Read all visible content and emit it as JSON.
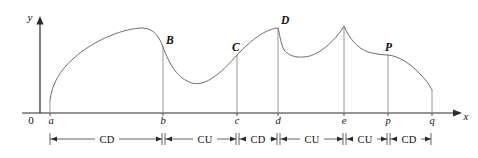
{
  "figure": {
    "axes": {
      "x_axis_label": "x",
      "y_axis_label": "y",
      "origin_label": "0"
    },
    "x_ticks": [
      {
        "id": "a",
        "label": "a",
        "x": 50
      },
      {
        "id": "b",
        "label": "b",
        "x": 163
      },
      {
        "id": "c",
        "label": "c",
        "x": 237
      },
      {
        "id": "d",
        "label": "d",
        "x": 278
      },
      {
        "id": "e",
        "label": "e",
        "x": 344
      },
      {
        "id": "p",
        "label": "p",
        "x": 388
      },
      {
        "id": "q",
        "label": "q",
        "x": 432
      }
    ],
    "curve_points": [
      {
        "label": "B",
        "x": 163,
        "y": 47
      },
      {
        "label": "C",
        "x": 237,
        "y": 55
      },
      {
        "label": "D",
        "x": 278,
        "y": 28
      },
      {
        "label": "P",
        "x": 388,
        "y": 55
      }
    ],
    "intervals": [
      {
        "label": "CD",
        "from": "a",
        "to": "b"
      },
      {
        "label": "CU",
        "from": "b",
        "to": "c"
      },
      {
        "label": "CD",
        "from": "c",
        "to": "d"
      },
      {
        "label": "CU",
        "from": "d",
        "to": "e"
      },
      {
        "label": "CU",
        "from": "e",
        "to": "p"
      },
      {
        "label": "CD",
        "from": "p",
        "to": "q"
      }
    ],
    "colors": {
      "curve": "#6e6e6e",
      "axis": "#2b2b2b",
      "dropline": "#8a8a8a",
      "text": "#111111",
      "background": "#ffffff"
    }
  }
}
